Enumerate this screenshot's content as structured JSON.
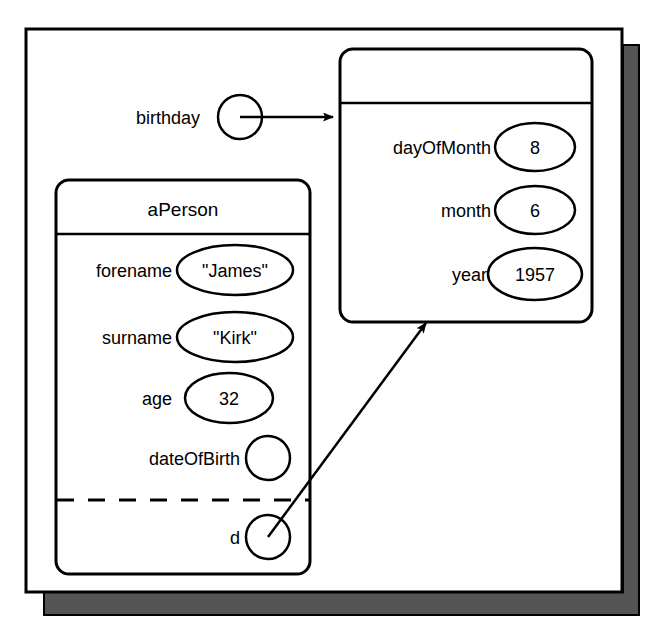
{
  "diagram": {
    "kind": "object-diagram",
    "frame": {
      "name": "diagram-frame",
      "shadow_color": "#555555",
      "border_color": "#000000",
      "fill_color": "#ffffff"
    },
    "objects": [
      {
        "id": "person",
        "title": "aPerson",
        "has_title": true,
        "attributes": [
          {
            "name": "forename",
            "value": "\"James\"",
            "value_kind": "ellipse"
          },
          {
            "name": "surname",
            "value": "\"Kirk\"",
            "value_kind": "ellipse"
          },
          {
            "name": "age",
            "value": "32",
            "value_kind": "ellipse"
          },
          {
            "name": "dateOfBirth",
            "value": "",
            "value_kind": "circle"
          }
        ],
        "separator": "dashed",
        "locals": [
          {
            "name": "d",
            "value": "",
            "value_kind": "circle"
          }
        ]
      },
      {
        "id": "date",
        "title": "",
        "has_title": true,
        "attributes": [
          {
            "name": "dayOfMonth",
            "value": "8",
            "value_kind": "ellipse"
          },
          {
            "name": "month",
            "value": "6",
            "value_kind": "ellipse"
          },
          {
            "name": "year",
            "value": "1957",
            "value_kind": "ellipse"
          }
        ],
        "separator": "none",
        "locals": []
      }
    ],
    "links": [
      {
        "id": "birthday-link",
        "label": "birthday",
        "from": "birthday-slot",
        "to": "date",
        "style": "straight-arrow"
      },
      {
        "id": "d-link",
        "label": "",
        "from": "person.d",
        "to": "date",
        "style": "straight-arrow"
      }
    ]
  }
}
